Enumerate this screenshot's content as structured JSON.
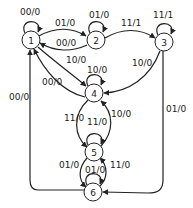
{
  "diagram": {
    "type": "state-machine",
    "nodes": [
      {
        "id": "1",
        "label": "1"
      },
      {
        "id": "2",
        "label": "2"
      },
      {
        "id": "3",
        "label": "3"
      },
      {
        "id": "4",
        "label": "4"
      },
      {
        "id": "5",
        "label": "5"
      },
      {
        "id": "6",
        "label": "6"
      }
    ],
    "edges": [
      {
        "from": "1",
        "to": "1",
        "label": "00/0"
      },
      {
        "from": "1",
        "to": "2",
        "label": "01/0"
      },
      {
        "from": "2",
        "to": "1",
        "label": "00/0"
      },
      {
        "from": "2",
        "to": "2",
        "label": "01/0"
      },
      {
        "from": "2",
        "to": "3",
        "label": "11/1"
      },
      {
        "from": "3",
        "to": "3",
        "label": "11/1"
      },
      {
        "from": "3",
        "to": "4",
        "label": "10/0"
      },
      {
        "from": "1",
        "to": "4",
        "label": "10/0"
      },
      {
        "from": "4",
        "to": "1",
        "label": "00/0"
      },
      {
        "from": "4",
        "to": "4",
        "label": "10/0"
      },
      {
        "from": "4",
        "to": "5",
        "label": "11/0"
      },
      {
        "from": "5",
        "to": "4",
        "label": "10/0"
      },
      {
        "from": "5",
        "to": "5",
        "label": "11/0"
      },
      {
        "from": "5",
        "to": "6",
        "label": "01/0"
      },
      {
        "from": "6",
        "to": "5",
        "label": "11/0"
      },
      {
        "from": "6",
        "to": "6",
        "label": "01/0"
      },
      {
        "from": "3",
        "to": "6",
        "label": "01/0"
      },
      {
        "from": "6",
        "to": "1",
        "label": "00/0"
      }
    ]
  }
}
